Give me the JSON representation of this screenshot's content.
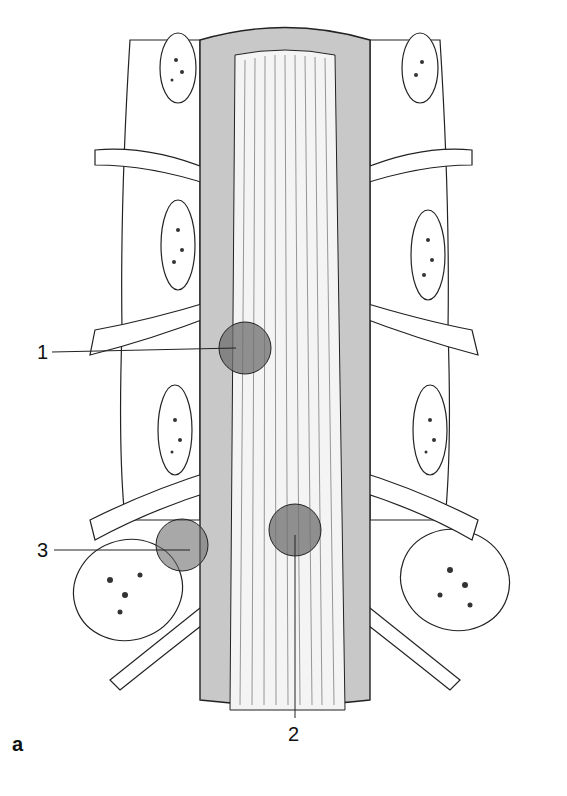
{
  "figure": {
    "panel_label": "a",
    "labels": [
      {
        "id": "1",
        "text": "1",
        "x": 37,
        "y": 352,
        "target": [
          240,
          348
        ]
      },
      {
        "id": "2",
        "text": "2",
        "x": 290,
        "y": 735,
        "target": [
          295,
          530
        ]
      },
      {
        "id": "3",
        "text": "3",
        "x": 37,
        "y": 550,
        "target": [
          190,
          550
        ]
      }
    ],
    "lesions": [
      {
        "id": "1",
        "cx": 245,
        "cy": 348,
        "r": 26
      },
      {
        "id": "2",
        "cx": 295,
        "cy": 530,
        "r": 26
      },
      {
        "id": "3",
        "cx": 182,
        "cy": 545,
        "r": 26
      }
    ],
    "colors": {
      "dura": "#c8c8c8",
      "lesion": "#6e6e6e",
      "line": "#222222",
      "paper": "#ffffff"
    }
  }
}
